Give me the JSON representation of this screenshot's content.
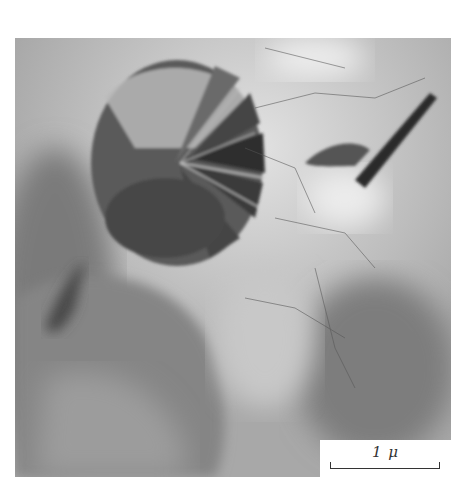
{
  "figure": {
    "type": "grayscale electron micrograph",
    "scale_bar": {
      "label": "1 μ",
      "length_px": 110
    },
    "colors": {
      "background": "#ffffff",
      "scale_box": "#ffffff",
      "mid_gray": "#9a9a9a",
      "dark_feature": "#3a3a3a",
      "light_region": "#dcdcdc"
    }
  }
}
